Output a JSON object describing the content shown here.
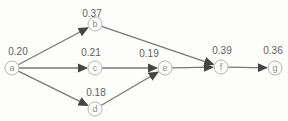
{
  "diagram": {
    "colors": {
      "background": "#fdfdfc",
      "edge": "#787878",
      "arrowhead": "#454545",
      "node_fill": "#fdfdfc",
      "node_stroke": "#b5b5b5",
      "node_letter": "#8c8c8c",
      "value_text": "#5f5f5f"
    },
    "node_radius": 7,
    "nodes": [
      {
        "id": "a",
        "x": 12,
        "y": 68,
        "value": "0.20",
        "vx": 18,
        "vy": 51
      },
      {
        "id": "b",
        "x": 95,
        "y": 24,
        "value": "0.37",
        "vx": 92,
        "vy": 13
      },
      {
        "id": "c",
        "x": 95,
        "y": 68,
        "value": "0.21",
        "vx": 91,
        "vy": 52
      },
      {
        "id": "d",
        "x": 95,
        "y": 109,
        "value": "0.18",
        "vx": 96,
        "vy": 92
      },
      {
        "id": "e",
        "x": 165,
        "y": 68,
        "value": "0.19",
        "vx": 149,
        "vy": 53
      },
      {
        "id": "f",
        "x": 221,
        "y": 67,
        "value": "0.39",
        "vx": 222,
        "vy": 50
      },
      {
        "id": "g",
        "x": 275,
        "y": 68,
        "value": "0.36",
        "vx": 273,
        "vy": 50
      }
    ],
    "edges": [
      {
        "from": "a",
        "to": "b"
      },
      {
        "from": "a",
        "to": "c"
      },
      {
        "from": "a",
        "to": "d"
      },
      {
        "from": "b",
        "to": "f"
      },
      {
        "from": "c",
        "to": "e"
      },
      {
        "from": "d",
        "to": "e"
      },
      {
        "from": "e",
        "to": "f"
      },
      {
        "from": "f",
        "to": "g"
      }
    ]
  }
}
